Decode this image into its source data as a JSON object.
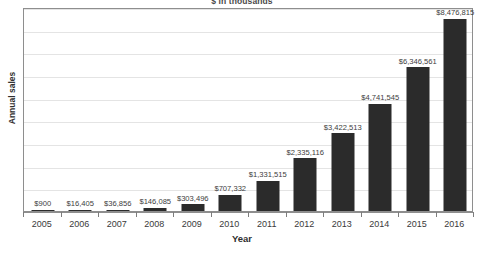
{
  "chart_data": {
    "type": "bar",
    "title": "$ in thousands",
    "xlabel": "Year",
    "ylabel": "Annual sales",
    "categories": [
      "2005",
      "2006",
      "2007",
      "2008",
      "2009",
      "2010",
      "2011",
      "2012",
      "2013",
      "2014",
      "2015",
      "2016"
    ],
    "values": [
      900,
      16405,
      36856,
      146085,
      303496,
      707332,
      1331515,
      2335116,
      3422513,
      4741545,
      6346561,
      8476815
    ],
    "data_labels": [
      "$900",
      "$16,405",
      "$36,856",
      "$146,085",
      "$303,496",
      "$707,332",
      "$1,331,515",
      "$2,335,116",
      "$3,422,513",
      "$4,741,545",
      "$6,346,561",
      "$8,476,815"
    ],
    "ylim": [
      0,
      9000000
    ],
    "gridlines": [
      1000000,
      2000000,
      3000000,
      4000000,
      5000000,
      6000000,
      7000000,
      8000000,
      9000000
    ],
    "grid": true,
    "legend": false,
    "bar_color": "#2b2b2b",
    "grid_color": "#e4e4e4",
    "axis_color": "#8e8e8e",
    "background": "#ffffff"
  },
  "footnote": ""
}
